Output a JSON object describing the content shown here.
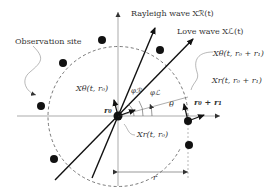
{
  "diagram": {
    "labels": {
      "rayleigh": "Rayleigh wave Xℛ(t)",
      "love": "Love wave Xℒ(t)",
      "observation_site": "Observation site",
      "x_theta_r0": "Xθ(t, r₀)",
      "x_theta_r0r1": "Xθ(t, r₀ + r₁)",
      "x_r_r0r1": "Xr(t, r₀ + r₁)",
      "x_r_r0": "Xr(t, r₀)",
      "r0": "r₀",
      "r0r1": "r₀ + r₁",
      "phi_R": "φℛ",
      "phi_L": "φℒ",
      "theta": "θ",
      "r": "r"
    },
    "colors": {
      "line": "#111111",
      "axis": "#777777",
      "text": "#333333"
    }
  }
}
